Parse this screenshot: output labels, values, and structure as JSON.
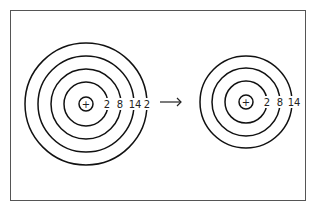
{
  "diagram": {
    "before": {
      "shells": [
        "2",
        "8",
        "14",
        "2"
      ],
      "nucleus_symbol": "+"
    },
    "arrow": "→",
    "after": {
      "shells": [
        "2",
        "8",
        "14"
      ],
      "nucleus_symbol": "+"
    }
  }
}
